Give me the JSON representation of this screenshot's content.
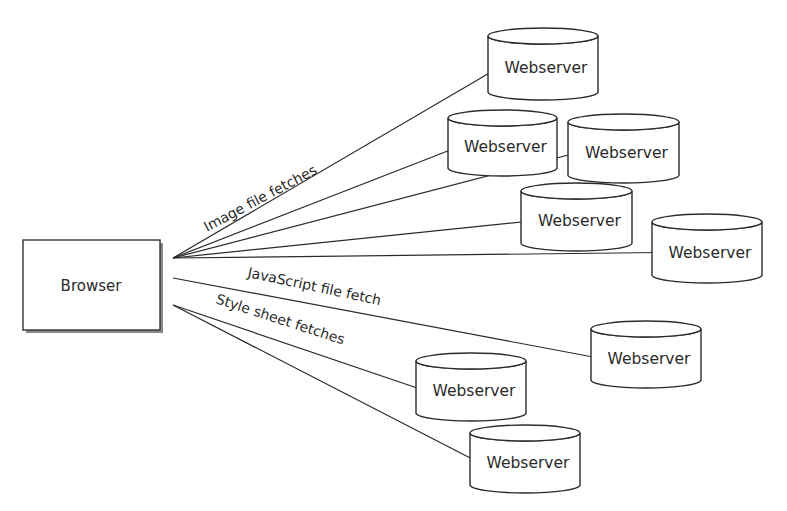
{
  "caption_fragment": "",
  "browser": {
    "label": "Browser"
  },
  "edge_labels": {
    "image": "Image file fetches",
    "javascript": "JavaScript file fetch",
    "stylesheet": "Style sheet fetches"
  },
  "servers": [
    {
      "id": "img-1",
      "label": "Webserver",
      "group": "image"
    },
    {
      "id": "img-2",
      "label": "Webserver",
      "group": "image"
    },
    {
      "id": "img-3",
      "label": "Webserver",
      "group": "image"
    },
    {
      "id": "img-4",
      "label": "Webserver",
      "group": "image"
    },
    {
      "id": "img-5",
      "label": "Webserver",
      "group": "image"
    },
    {
      "id": "js-1",
      "label": "Webserver",
      "group": "javascript"
    },
    {
      "id": "css-1",
      "label": "Webserver",
      "group": "stylesheet"
    },
    {
      "id": "css-2",
      "label": "Webserver",
      "group": "stylesheet"
    }
  ],
  "colors": {
    "stroke": "#2a2a2a",
    "background": "#ffffff"
  }
}
